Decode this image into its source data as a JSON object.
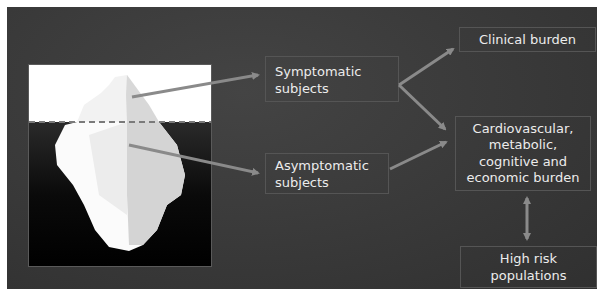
{
  "figure": {
    "background_color": "#383838",
    "arrow_color": "#8a8a8a",
    "waterline_style": "dashed",
    "iceberg_image": {
      "description": "iceberg above and below waterline",
      "above_water_color": "#ffffff",
      "below_water_color": "#000000"
    },
    "nodes": {
      "symptomatic": {
        "label_line1": "Symptomatic",
        "label_line2": "subjects"
      },
      "asymptomatic": {
        "label_line1": "Asymptomatic",
        "label_line2": "subjects"
      },
      "clinical": {
        "label": "Clinical burden"
      },
      "cardio": {
        "line1": "Cardiovascular,",
        "line2": "metabolic,",
        "line3": "cognitive and",
        "line4": "economic burden"
      },
      "highrisk": {
        "line1": "High risk",
        "line2": "populations"
      }
    },
    "edges": [
      {
        "from": "iceberg-tip",
        "to": "symptomatic"
      },
      {
        "from": "iceberg-submerged",
        "to": "asymptomatic"
      },
      {
        "from": "symptomatic",
        "to": "clinical"
      },
      {
        "from": "symptomatic",
        "to": "cardio"
      },
      {
        "from": "asymptomatic",
        "to": "cardio"
      },
      {
        "from": "cardio",
        "to": "highrisk",
        "bidirectional": true
      }
    ]
  }
}
